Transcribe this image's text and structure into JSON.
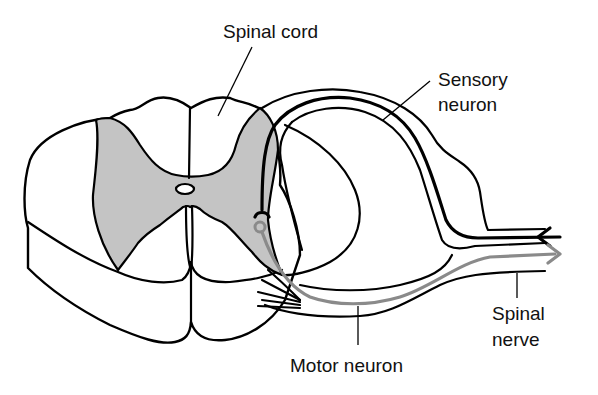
{
  "diagram": {
    "labels": {
      "spinal_cord": "Spinal cord",
      "sensory_neuron_line1": "Sensory",
      "sensory_neuron_line2": "neuron",
      "spinal_nerve_line1": "Spinal",
      "spinal_nerve_line2": "nerve",
      "motor_neuron": "Motor neuron"
    },
    "colors": {
      "grey_matter": "#c4c4c4",
      "motor_neuron": "#8a8a8a",
      "sensory_neuron": "#000000",
      "outline": "#000000",
      "background": "#ffffff"
    },
    "arrows": {
      "sensory_direction": "inward (toward spinal cord)",
      "motor_direction": "outward (away from spinal cord)"
    }
  }
}
